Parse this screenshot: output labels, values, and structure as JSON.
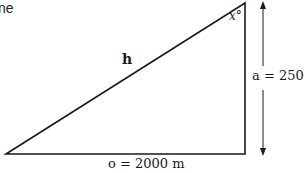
{
  "header": {
    "partial_text": "ne"
  },
  "diagram": {
    "type": "right-triangle",
    "labels": {
      "hypotenuse": "h",
      "angle": "x°",
      "vertical_side": "a = 250 m",
      "horizontal_side": "o = 2000 m"
    },
    "colors": {
      "stroke": "#1a1a1a",
      "background": "#ffffff"
    }
  }
}
